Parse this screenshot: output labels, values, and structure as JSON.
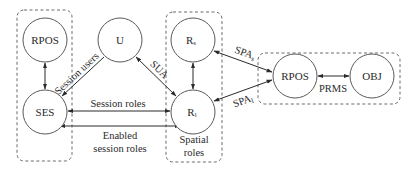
{
  "diagram": {
    "groups": [
      {
        "id": "left-group",
        "label": ""
      },
      {
        "id": "spatial-roles-group",
        "label_line1": "Spatial",
        "label_line2": "roles"
      },
      {
        "id": "right-group",
        "label": ""
      }
    ],
    "nodes": {
      "rpos_left": {
        "label": "RPOS"
      },
      "ses": {
        "label": "SES"
      },
      "u": {
        "label": "U"
      },
      "rs": {
        "label": "R",
        "sub": "s"
      },
      "rl": {
        "label": "R",
        "sub": "l"
      },
      "rpos_right": {
        "label": "RPOS"
      },
      "obj": {
        "label": "OBJ"
      }
    },
    "edges": {
      "session_users": {
        "label": "Session users"
      },
      "sua": {
        "label": "SUA"
      },
      "session_roles": {
        "label": "Session roles"
      },
      "enabled_line1": "Enabled",
      "enabled_line2": "session roles",
      "spa_s": {
        "label": "SPA",
        "sub": "s"
      },
      "spa_l": {
        "label": "SPA",
        "sub": "l"
      },
      "prms": {
        "label": "PRMS"
      }
    },
    "colors": {
      "stroke": "#2a2a2a",
      "box": "#6a6a6a",
      "background": "#ffffff"
    }
  }
}
